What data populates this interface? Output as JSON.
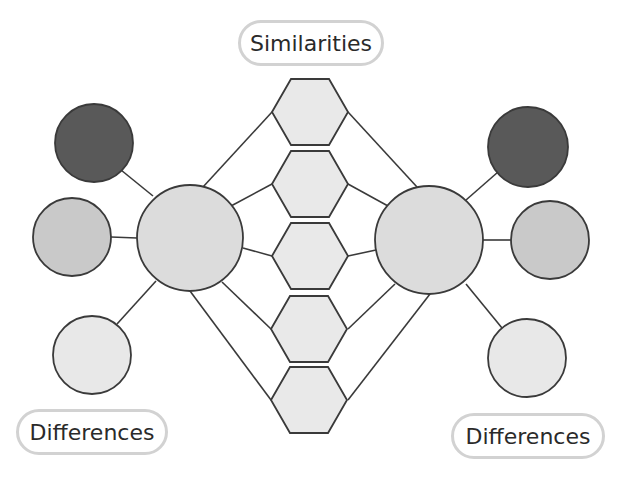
{
  "diagram": {
    "type": "double-bubble-map",
    "labels": {
      "similarities": "Similarities",
      "differences_left": "Differences",
      "differences_right": "Differences"
    },
    "colors": {
      "stroke": "#3a3a3a",
      "dark_circle": "#595959",
      "mid_circle": "#c9c9c9",
      "light_circle": "#e8e8e8",
      "center_circle": "#dcdcdc",
      "hexagon": "#e9e9e9",
      "pill_border": "#d2d2d2"
    },
    "left_topic": {
      "text": "",
      "shape": "circle"
    },
    "right_topic": {
      "text": "",
      "shape": "circle"
    },
    "similarity_nodes": [
      {
        "text": ""
      },
      {
        "text": ""
      },
      {
        "text": ""
      },
      {
        "text": ""
      },
      {
        "text": ""
      }
    ],
    "left_difference_nodes": [
      {
        "text": "",
        "shade": "dark"
      },
      {
        "text": "",
        "shade": "mid"
      },
      {
        "text": "",
        "shade": "light"
      }
    ],
    "right_difference_nodes": [
      {
        "text": "",
        "shade": "dark"
      },
      {
        "text": "",
        "shade": "mid"
      },
      {
        "text": "",
        "shade": "light"
      }
    ]
  }
}
